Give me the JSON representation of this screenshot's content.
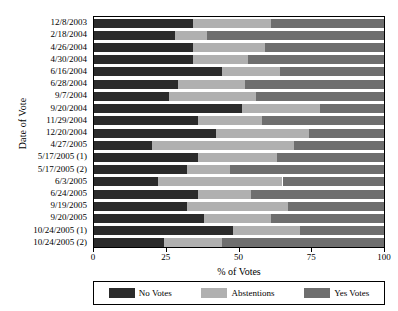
{
  "chart_data": {
    "type": "bar",
    "orientation": "horizontal",
    "stacked": true,
    "title": "",
    "xlabel": "% of Votes",
    "ylabel": "Date of Vote",
    "xlim": [
      0,
      100
    ],
    "xticks": [
      0,
      25,
      50,
      75,
      100
    ],
    "xtick_labels": [
      "0",
      "25",
      "50",
      "75",
      "100"
    ],
    "grid": false,
    "legend_position": "bottom",
    "legend": [
      "No Votes",
      "Abstentions",
      "Yes Votes"
    ],
    "colors": {
      "no_votes": "#2b2b2b",
      "abstentions": "#b0b0b0",
      "yes_votes": "#6e6e6e"
    },
    "categories": [
      "12/8/2003",
      "2/18/2004",
      "4/26/2004",
      "4/30/2004",
      "6/16/2004",
      "6/28/2004",
      "9/7/2004",
      "9/20/2004",
      "11/29/2004",
      "12/20/2004",
      "4/27/2005",
      "5/17/2005 (1)",
      "5/17/2005 (2)",
      "6/3/2005",
      "6/24/2005",
      "9/19/2005",
      "9/20/2005",
      "10/24/2005 (1)",
      "10/24/2005 (2)"
    ],
    "series": [
      {
        "name": "No Votes",
        "values": [
          34,
          28,
          34,
          34,
          44,
          29,
          26,
          51,
          36,
          42,
          20,
          36,
          32,
          22,
          36,
          32,
          38,
          48,
          24
        ]
      },
      {
        "name": "Abstentions",
        "values": [
          27,
          11,
          25,
          19,
          20,
          23,
          30,
          27,
          22,
          32,
          49,
          27,
          15,
          43,
          18,
          35,
          23,
          23,
          20
        ]
      },
      {
        "name": "Yes Votes",
        "values": [
          39,
          61,
          41,
          47,
          36,
          48,
          44,
          22,
          42,
          26,
          31,
          37,
          53,
          35,
          46,
          33,
          39,
          29,
          56
        ]
      }
    ]
  }
}
